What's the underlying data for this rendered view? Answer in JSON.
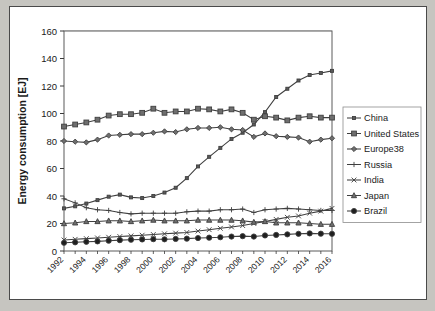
{
  "figure": {
    "background_color": "#ffffff",
    "page_color": "#c6c5c0",
    "border_color": "#4a4a4a"
  },
  "chart_data": {
    "type": "line",
    "title": "",
    "xlabel": "",
    "ylabel": "Energy consumption [EJ]",
    "ylim": [
      0,
      160
    ],
    "ytick_step": 20,
    "yticks": [
      0,
      20,
      40,
      60,
      80,
      100,
      120,
      140,
      160
    ],
    "grid": "horizontal",
    "legend_position": "right",
    "x": [
      1992,
      1993,
      1994,
      1995,
      1996,
      1997,
      1998,
      1999,
      2000,
      2001,
      2002,
      2003,
      2004,
      2005,
      2006,
      2007,
      2008,
      2009,
      2010,
      2011,
      2012,
      2013,
      2014,
      2015,
      2016
    ],
    "xtick_labels": [
      "1992",
      "1994",
      "1996",
      "1998",
      "2000",
      "2002",
      "2004",
      "2006",
      "2008",
      "2010",
      "2012",
      "2014",
      "2016"
    ],
    "series": [
      {
        "name": "China",
        "marker": "small-square",
        "values": [
          31.0,
          32.5,
          34.5,
          37.0,
          39.5,
          41.0,
          39.0,
          38.5,
          40.0,
          42.5,
          46.0,
          53.0,
          61.5,
          68.5,
          75.0,
          81.5,
          86.0,
          92.0,
          101.0,
          112.0,
          118.0,
          124.0,
          128.0,
          129.5,
          131.0
        ]
      },
      {
        "name": "United States",
        "marker": "filled-square",
        "values": [
          90.5,
          92.0,
          93.5,
          95.5,
          98.5,
          99.5,
          99.5,
          100.5,
          103.5,
          100.5,
          101.5,
          101.5,
          103.5,
          103.0,
          101.5,
          103.0,
          100.5,
          95.5,
          98.0,
          97.0,
          95.0,
          97.0,
          98.0,
          97.0,
          97.0
        ]
      },
      {
        "name": "Europe38",
        "marker": "diamond",
        "values": [
          80.0,
          79.5,
          79.0,
          81.0,
          84.0,
          84.5,
          85.0,
          85.0,
          86.0,
          87.0,
          86.5,
          88.5,
          89.5,
          89.5,
          90.0,
          88.5,
          88.0,
          83.0,
          85.5,
          83.5,
          83.0,
          82.5,
          79.5,
          81.0,
          82.0
        ]
      },
      {
        "name": "Russia",
        "marker": "plus",
        "values": [
          38.0,
          35.0,
          31.5,
          30.0,
          29.5,
          28.0,
          27.0,
          27.5,
          27.5,
          27.5,
          27.5,
          28.5,
          29.0,
          29.0,
          30.0,
          30.0,
          30.5,
          28.0,
          30.0,
          30.5,
          31.0,
          30.5,
          30.0,
          29.5,
          29.5
        ]
      },
      {
        "name": "India",
        "marker": "cross",
        "values": [
          8.0,
          8.5,
          9.0,
          9.5,
          10.0,
          10.5,
          11.0,
          11.5,
          12.0,
          12.5,
          13.0,
          13.5,
          14.5,
          15.5,
          16.5,
          17.5,
          18.5,
          20.0,
          21.5,
          23.0,
          24.5,
          25.5,
          27.5,
          29.0,
          31.0
        ]
      },
      {
        "name": "Japan",
        "marker": "triangle",
        "values": [
          20.0,
          20.5,
          21.5,
          21.5,
          22.0,
          22.0,
          21.5,
          22.0,
          22.5,
          22.0,
          22.0,
          22.0,
          22.5,
          22.5,
          22.5,
          22.5,
          22.0,
          21.0,
          21.5,
          20.5,
          20.5,
          20.5,
          20.0,
          19.5,
          19.5
        ]
      },
      {
        "name": "Brazil",
        "marker": "filled-circle",
        "values": [
          6.0,
          6.3,
          6.7,
          7.0,
          7.5,
          7.9,
          8.2,
          8.4,
          8.6,
          8.5,
          8.8,
          9.0,
          9.4,
          9.7,
          10.0,
          10.5,
          10.8,
          10.5,
          11.3,
          11.7,
          12.1,
          12.5,
          12.8,
          12.6,
          12.5
        ]
      }
    ]
  },
  "legend": {
    "items": [
      {
        "label": "China"
      },
      {
        "label": "United States"
      },
      {
        "label": "Europe38"
      },
      {
        "label": "Russia"
      },
      {
        "label": "India"
      },
      {
        "label": "Japan"
      },
      {
        "label": "Brazil"
      }
    ]
  }
}
